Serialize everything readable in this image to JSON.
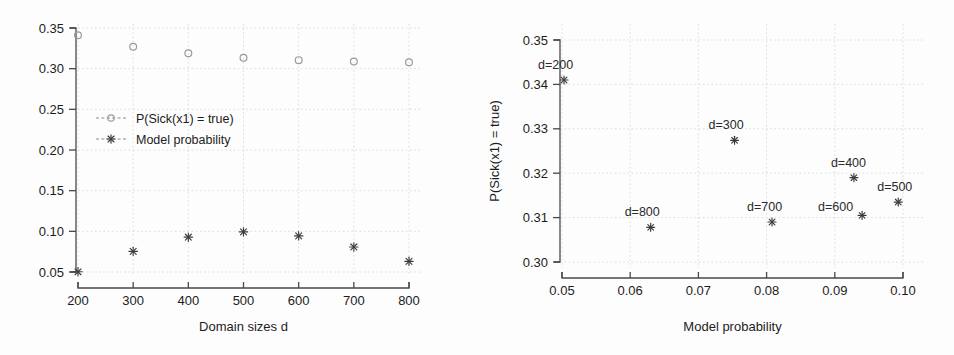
{
  "figure": {
    "background_color": "#fdfdfd",
    "panel_count": 2
  },
  "chart_data": [
    {
      "type": "scatter",
      "panel": "left",
      "title": "",
      "xlabel": "Domain sizes d",
      "ylabel": "",
      "x": [
        200,
        300,
        400,
        500,
        600,
        700,
        800
      ],
      "xticks": [
        "200",
        "300",
        "400",
        "500",
        "600",
        "700",
        "800"
      ],
      "yticks": [
        "0.05",
        "0.10",
        "0.15",
        "0.20",
        "0.25",
        "0.30",
        "0.35"
      ],
      "xlim": [
        200,
        800
      ],
      "ylim": [
        0.05,
        0.35
      ],
      "grid": true,
      "legend_position": "upper-left",
      "series": [
        {
          "name": "P(Sick(x1) = true)",
          "marker": "open-circle",
          "values": [
            0.341,
            0.327,
            0.319,
            0.3135,
            0.3105,
            0.3088,
            0.3078
          ]
        },
        {
          "name": "Model probability",
          "marker": "star",
          "values": [
            0.0503,
            0.0753,
            0.0928,
            0.0993,
            0.0944,
            0.0808,
            0.0631
          ]
        }
      ]
    },
    {
      "type": "scatter",
      "panel": "right",
      "title": "",
      "xlabel": "Model probability",
      "ylabel": "P(Sick(x1) = true)",
      "xticks": [
        "0.05",
        "0.06",
        "0.07",
        "0.08",
        "0.09",
        "0.10"
      ],
      "yticks": [
        "0.30",
        "0.31",
        "0.32",
        "0.33",
        "0.34",
        "0.35"
      ],
      "xlim": [
        0.05,
        0.1
      ],
      "ylim": [
        0.3,
        0.35
      ],
      "grid": true,
      "marker": "star",
      "points": [
        {
          "label": "d=200",
          "x": 0.0503,
          "y": 0.341,
          "label_dx": -26,
          "label_dy": -11
        },
        {
          "label": "d=300",
          "x": 0.0753,
          "y": 0.3274,
          "label_dx": -26,
          "label_dy": -11
        },
        {
          "label": "d=400",
          "x": 0.0928,
          "y": 0.319,
          "label_dx": -23,
          "label_dy": -11
        },
        {
          "label": "d=500",
          "x": 0.0993,
          "y": 0.3135,
          "label_dx": -21,
          "label_dy": -11
        },
        {
          "label": "d=600",
          "x": 0.094,
          "y": 0.3105,
          "label_dx": -44,
          "label_dy": -4
        },
        {
          "label": "d=700",
          "x": 0.0808,
          "y": 0.309,
          "label_dx": -25,
          "label_dy": -11
        },
        {
          "label": "d=800",
          "x": 0.063,
          "y": 0.3078,
          "label_dx": -26,
          "label_dy": -11
        }
      ]
    }
  ]
}
